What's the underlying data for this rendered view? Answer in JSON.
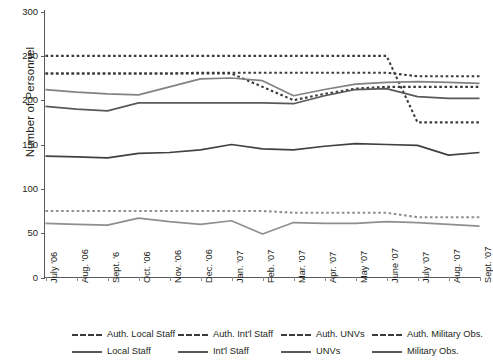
{
  "chart_data": {
    "type": "line",
    "title": "",
    "xlabel": "",
    "ylabel": "Number of Personnel",
    "ylim": [
      0,
      300
    ],
    "yticks": [
      0,
      50,
      100,
      150,
      200,
      250,
      300
    ],
    "grid": false,
    "legend_position": "bottom",
    "categories": [
      "July '06",
      "Aug. '06",
      "Sept. '6",
      "Oct. '06",
      "Nov. '06",
      "Dec. '06",
      "Jan. '07",
      "Feb. '07",
      "Mar. '07",
      "Apr. '07",
      "May '07",
      "June '07",
      "July '07",
      "Aug. '07",
      "Sept. '07"
    ],
    "series": [
      {
        "name": "Auth. Local Staff",
        "style": "dashed",
        "color": "#3b3b3d",
        "values": [
          250,
          250,
          250,
          250,
          250,
          250,
          250,
          250,
          250,
          250,
          250,
          250,
          175,
          175,
          175
        ]
      },
      {
        "name": "Auth. Int'l Staff",
        "style": "dashed",
        "color": "#3b3b3d",
        "values": [
          230,
          230,
          230,
          230,
          230,
          231,
          231,
          231,
          231,
          231,
          231,
          231,
          227,
          227,
          227
        ]
      },
      {
        "name": "Auth. UNVs",
        "style": "dashed",
        "color": "#8d8f92",
        "values": [
          75,
          75,
          75,
          75,
          75,
          75,
          75,
          75,
          73,
          73,
          73,
          73,
          68,
          68,
          68
        ]
      },
      {
        "name": "Auth. Military Obs.",
        "style": "dashed",
        "color": "#3b3b3d",
        "values": [
          230,
          230,
          230,
          230,
          230,
          230,
          230,
          215,
          200,
          207,
          213,
          215,
          215,
          215,
          215
        ]
      },
      {
        "name": "Local Staff",
        "style": "solid",
        "color": "#58595b",
        "values": [
          193,
          190,
          188,
          197,
          197,
          197,
          197,
          197,
          196,
          205,
          212,
          213,
          204,
          202,
          202
        ]
      },
      {
        "name": "Int'l Staff",
        "style": "solid",
        "color": "#808285",
        "values": [
          212,
          209,
          207,
          206,
          215,
          224,
          225,
          222,
          205,
          212,
          218,
          220,
          221,
          220,
          219
        ]
      },
      {
        "name": "UNVs",
        "style": "solid",
        "color": "#8d8f92",
        "values": [
          61,
          60,
          59,
          67,
          63,
          60,
          64,
          49,
          62,
          61,
          61,
          63,
          62,
          60,
          58
        ]
      },
      {
        "name": "Military Obs.",
        "style": "solid",
        "color": "#414042",
        "values": [
          137,
          136,
          135,
          140,
          141,
          144,
          150,
          145,
          144,
          148,
          151,
          150,
          149,
          138,
          141
        ]
      }
    ]
  },
  "legend": {
    "row1": [
      {
        "label": "Auth. Local Staff",
        "style": "dashed"
      },
      {
        "label": "Auth. Int'l Staff",
        "style": "dashed"
      },
      {
        "label": "Auth. UNVs",
        "style": "dashed"
      },
      {
        "label": "Auth. Military Obs.",
        "style": "dashed"
      }
    ],
    "row2": [
      {
        "label": "Local Staff",
        "style": "solid"
      },
      {
        "label": "Int'l Staff",
        "style": "solid"
      },
      {
        "label": "UNVs",
        "style": "solid"
      },
      {
        "label": "Military Obs.",
        "style": "solid"
      }
    ]
  },
  "colors": {
    "axis": "#58595b",
    "text": "#231f20",
    "dark_line": "#3b3b3d",
    "mid_line": "#808285",
    "light_line": "#8d8f92"
  }
}
